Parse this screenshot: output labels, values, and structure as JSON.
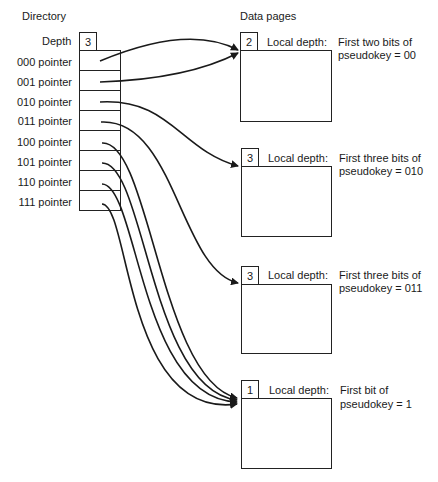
{
  "directory": {
    "title": "Directory",
    "depth_label": "Depth",
    "depth_value": "3",
    "pointers": [
      {
        "label": "000 pointer",
        "target_page": 0
      },
      {
        "label": "001 pointer",
        "target_page": 0
      },
      {
        "label": "010 pointer",
        "target_page": 1
      },
      {
        "label": "011 pointer",
        "target_page": 2
      },
      {
        "label": "100 pointer",
        "target_page": 3
      },
      {
        "label": "101 pointer",
        "target_page": 3
      },
      {
        "label": "110 pointer",
        "target_page": 3
      },
      {
        "label": "111 pointer",
        "target_page": 3
      }
    ]
  },
  "data_pages": {
    "title": "Data pages",
    "pages": [
      {
        "local_depth": "2",
        "local_depth_label": "Local depth:",
        "desc_line1": "First two bits of",
        "desc_line2": "pseudokey = 00"
      },
      {
        "local_depth": "3",
        "local_depth_label": "Local depth:",
        "desc_line1": "First three bits of",
        "desc_line2": "pseudokey = 010"
      },
      {
        "local_depth": "3",
        "local_depth_label": "Local depth:",
        "desc_line1": "First three bits of",
        "desc_line2": "pseudokey = 011"
      },
      {
        "local_depth": "1",
        "local_depth_label": "Local depth:",
        "desc_line1": "First bit of",
        "desc_line2": "pseudokey = 1"
      }
    ]
  },
  "colors": {
    "line": "#1a1a1a",
    "background": "#ffffff"
  }
}
